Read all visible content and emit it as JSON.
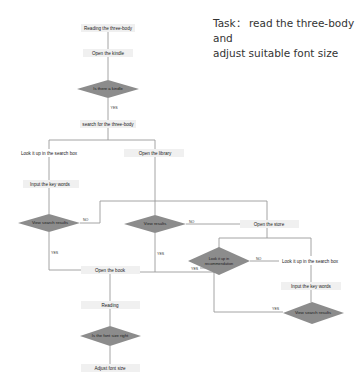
{
  "task": {
    "prefix": "Task：",
    "line1": " read the three-body and",
    "line2": "adjust suitable font size"
  },
  "colors": {
    "box_fill": "#f0f0f0",
    "diamond_fill": "#8c8c8c",
    "line": "#9a9a9a",
    "text": "#222222"
  },
  "nodes": {
    "start": "Reading the three-body",
    "open_kindle": "Open the kindle",
    "is_kindle": "Is there a kindle",
    "search": "search for the three-body",
    "lookup_left": "Look it up in the search box",
    "open_library": "Open the library",
    "input_left": "Input the key words",
    "view_search_left": "View search results",
    "view_results": "View results",
    "open_store": "Open the store",
    "open_book": "Open the book",
    "lookup_reco_1": "Look it up in",
    "lookup_reco_2": "recommendation",
    "lookup_right": "Look it up in the search box",
    "input_right": "Input the key words",
    "view_search_right": "View search results",
    "reading": "Reading",
    "font_right": "Is the font size right",
    "adjust": "Adjust font size"
  },
  "labels": {
    "yes_kindle": "YES",
    "no_search_left": "NO",
    "yes_search_left": "YES",
    "no_results": "NO",
    "yes_results": "YES",
    "no_reco": "NO",
    "yes_reco": "YES",
    "yes_search_right": "YES"
  }
}
